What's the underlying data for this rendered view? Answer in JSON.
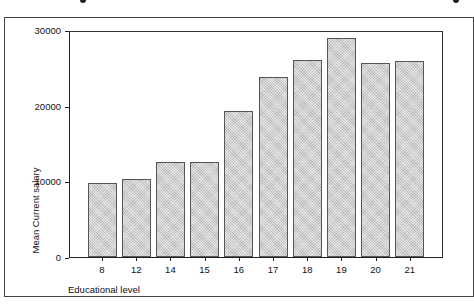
{
  "chart_data": {
    "type": "bar",
    "title": "",
    "xlabel": "Educational level",
    "ylabel": "Mean Current salary",
    "categories": [
      "8",
      "12",
      "14",
      "15",
      "16",
      "17",
      "18",
      "19",
      "20",
      "21"
    ],
    "values": [
      9800,
      10300,
      12600,
      12600,
      19300,
      23800,
      26000,
      28900,
      25600,
      25900
    ],
    "ylim": [
      0,
      30000
    ],
    "yticks": [
      "0",
      "10000",
      "20000",
      "30000"
    ],
    "grid": false,
    "legend": null,
    "bar_color": "#cfcfcf"
  }
}
